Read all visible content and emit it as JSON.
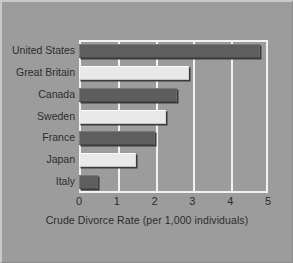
{
  "chart_data": {
    "type": "bar",
    "orientation": "horizontal",
    "title": "",
    "xlabel": "Crude Divorce Rate (per 1,000 individuals)",
    "ylabel": "",
    "categories": [
      "United States",
      "Great Britain",
      "Canada",
      "Sweden",
      "France",
      "Japan",
      "Italy"
    ],
    "values": [
      4.8,
      2.9,
      2.6,
      2.3,
      2.0,
      1.5,
      0.5
    ],
    "xlim": [
      0,
      5
    ],
    "xticks": [
      "0",
      "1",
      "2",
      "3",
      "4",
      "5"
    ],
    "grid": true,
    "legend": "none",
    "bar_colors": [
      "#5e5e5e",
      "#e9e9e9",
      "#5e5e5e",
      "#e9e9e9",
      "#5e5e5e",
      "#e9e9e9",
      "#5e5e5e"
    ],
    "colors": {
      "background": "#9c9c9c",
      "plot_frame": "#f2f2f2",
      "gridline": "#f2f2f2",
      "text": "#2c2c2c",
      "bar_dark": "#5e5e5e",
      "bar_light": "#e9e9e9",
      "bar_shadow": "#3a3a3a"
    }
  }
}
